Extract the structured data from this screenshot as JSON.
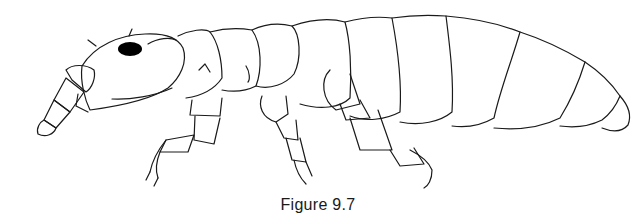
{
  "figure": {
    "caption": "Figure 9.7",
    "stroke_color": "#1a1a1a",
    "background": "#ffffff"
  }
}
